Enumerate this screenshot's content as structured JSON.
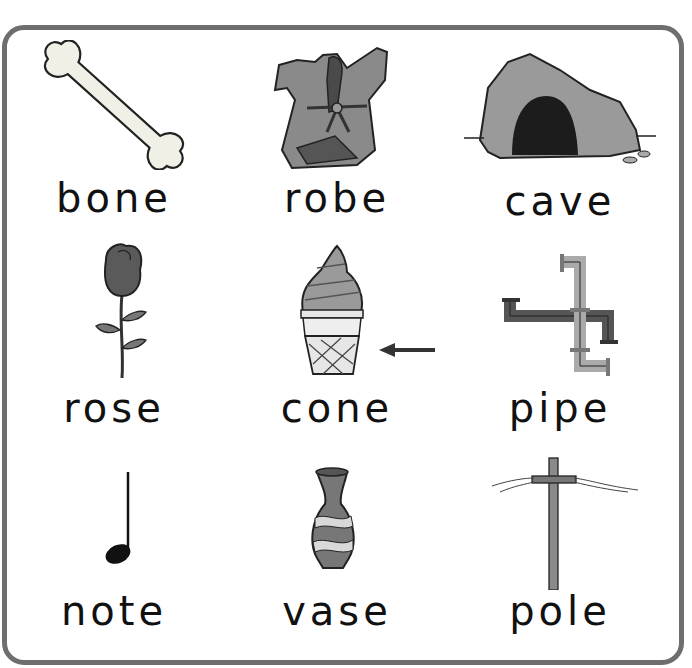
{
  "worksheet": {
    "items": [
      {
        "word": "bone",
        "icon": "bone-icon"
      },
      {
        "word": "robe",
        "icon": "robe-icon"
      },
      {
        "word": "cave",
        "icon": "cave-icon"
      },
      {
        "word": "rose",
        "icon": "rose-icon"
      },
      {
        "word": "cone",
        "icon": "ice-cream-cone-icon",
        "marker": "arrow-left-icon"
      },
      {
        "word": "pipe",
        "icon": "pipe-icon"
      },
      {
        "word": "note",
        "icon": "music-note-icon"
      },
      {
        "word": "vase",
        "icon": "vase-icon"
      },
      {
        "word": "pole",
        "icon": "utility-pole-icon"
      }
    ],
    "colors": {
      "border": "#6e6e6e",
      "text": "#111111"
    }
  }
}
